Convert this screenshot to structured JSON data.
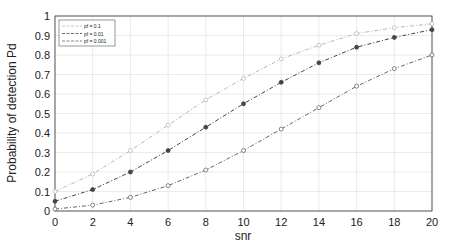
{
  "chart_data": {
    "type": "line",
    "title": "",
    "xlabel": "snr",
    "ylabel": "Probability of  detection Pd",
    "xlim": [
      0,
      20
    ],
    "ylim": [
      0,
      1
    ],
    "grid": true,
    "legend_position": "upper-left",
    "x_ticks": [
      "0",
      "2",
      "4",
      "6",
      "8",
      "10",
      "12",
      "14",
      "16",
      "18",
      "20"
    ],
    "y_ticks": [
      "0",
      "0.1",
      "0.2",
      "0.3",
      "0.4",
      "0.5",
      "0.6",
      "0.7",
      "0.8",
      "0.9",
      "1"
    ],
    "x": [
      0,
      2,
      4,
      6,
      8,
      10,
      12,
      14,
      16,
      18,
      20
    ],
    "series": [
      {
        "name": "pf = 0.1",
        "color": "#b8b8b8",
        "marker": "circle-open",
        "values": [
          0.1,
          0.19,
          0.31,
          0.44,
          0.57,
          0.68,
          0.78,
          0.85,
          0.91,
          0.94,
          0.96
        ]
      },
      {
        "name": "pf = 0.01",
        "color": "#444444",
        "marker": "circle-filled",
        "values": [
          0.05,
          0.11,
          0.2,
          0.31,
          0.43,
          0.55,
          0.66,
          0.76,
          0.84,
          0.89,
          0.93
        ]
      },
      {
        "name": "pf = 0.001",
        "color": "#666666",
        "marker": "circle-open",
        "values": [
          0.01,
          0.03,
          0.07,
          0.13,
          0.21,
          0.31,
          0.42,
          0.53,
          0.64,
          0.73,
          0.8
        ]
      }
    ]
  }
}
